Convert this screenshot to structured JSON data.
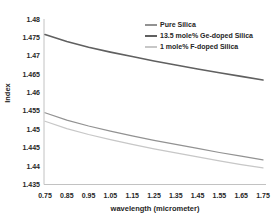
{
  "chart_data": {
    "type": "line",
    "title": "",
    "xlabel": "wavelength (micrometer)",
    "ylabel": "Index",
    "xlim": [
      0.75,
      1.75
    ],
    "ylim": [
      1.435,
      1.48
    ],
    "grid": false,
    "legend_position": "top-right-inside",
    "x_ticks": [
      0.75,
      0.85,
      0.95,
      1.05,
      1.15,
      1.25,
      1.35,
      1.45,
      1.55,
      1.65,
      1.75
    ],
    "y_ticks": [
      1.435,
      1.44,
      1.445,
      1.45,
      1.455,
      1.46,
      1.465,
      1.47,
      1.475,
      1.48
    ],
    "x": [
      0.75,
      0.85,
      0.95,
      1.05,
      1.15,
      1.25,
      1.35,
      1.45,
      1.55,
      1.65,
      1.75
    ],
    "series": [
      {
        "name": "Pure Silica",
        "color": "#929292",
        "values": [
          1.4545,
          1.4525,
          1.4509,
          1.4495,
          1.4482,
          1.447,
          1.4459,
          1.4448,
          1.4437,
          1.4427,
          1.4417
        ]
      },
      {
        "name": "13.5 mole% Ge-doped Silica",
        "color": "#606060",
        "values": [
          1.4758,
          1.4739,
          1.4723,
          1.471,
          1.4698,
          1.4686,
          1.4675,
          1.4664,
          1.4654,
          1.4644,
          1.4634
        ]
      },
      {
        "name": "1 mole% F-doped Silica",
        "color": "#c7c7c7",
        "values": [
          1.4522,
          1.4502,
          1.4486,
          1.4472,
          1.4459,
          1.4447,
          1.4436,
          1.4425,
          1.4414,
          1.4404,
          1.4395
        ]
      }
    ],
    "axis_line_color": "#c2c2c2",
    "text_color": "#262626",
    "background_color": "#ffffff"
  }
}
